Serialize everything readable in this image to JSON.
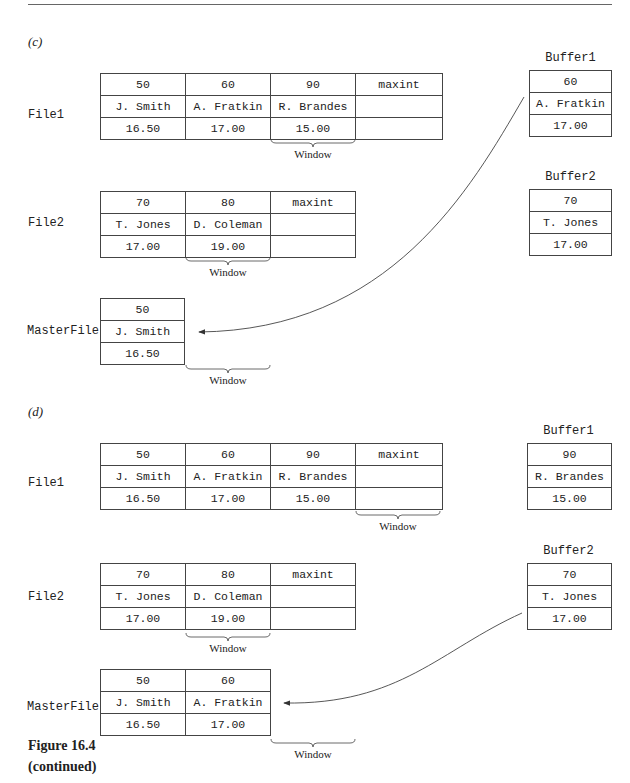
{
  "panels": {
    "c": {
      "label": "(c)",
      "file1": {
        "name": "File1",
        "keys": [
          "50",
          "60",
          "90",
          "maxint"
        ],
        "names": [
          "J. Smith",
          "A. Fratkin",
          "R. Brandes",
          ""
        ],
        "rates": [
          "16.50",
          "17.00",
          "15.00",
          ""
        ]
      },
      "file2": {
        "name": "File2",
        "keys": [
          "70",
          "80",
          "maxint"
        ],
        "names": [
          "T. Jones",
          "D. Coleman",
          ""
        ],
        "rates": [
          "17.00",
          "19.00",
          ""
        ]
      },
      "master": {
        "name": "MasterFile",
        "keys": [
          "50"
        ],
        "names": [
          "J. Smith"
        ],
        "rates": [
          "16.50"
        ]
      },
      "buffer1": {
        "name": "Buffer1",
        "key": "60",
        "nm": "A. Fratkin",
        "rate": "17.00"
      },
      "buffer2": {
        "name": "Buffer2",
        "key": "70",
        "nm": "T. Jones",
        "rate": "17.00"
      },
      "window_label": "Window"
    },
    "d": {
      "label": "(d)",
      "file1": {
        "name": "File1",
        "keys": [
          "50",
          "60",
          "90",
          "maxint"
        ],
        "names": [
          "J. Smith",
          "A. Fratkin",
          "R. Brandes",
          ""
        ],
        "rates": [
          "16.50",
          "17.00",
          "15.00",
          ""
        ]
      },
      "file2": {
        "name": "File2",
        "keys": [
          "70",
          "80",
          "maxint"
        ],
        "names": [
          "T. Jones",
          "D. Coleman",
          ""
        ],
        "rates": [
          "17.00",
          "19.00",
          ""
        ]
      },
      "master": {
        "name": "MasterFile",
        "keys": [
          "50",
          "60"
        ],
        "names": [
          "J. Smith",
          "A. Fratkin"
        ],
        "rates": [
          "16.50",
          "17.00"
        ]
      },
      "buffer1": {
        "name": "Buffer1",
        "key": "90",
        "nm": "R. Brandes",
        "rate": "15.00"
      },
      "buffer2": {
        "name": "Buffer2",
        "key": "70",
        "nm": "T. Jones",
        "rate": "17.00"
      },
      "window_label": "Window"
    }
  },
  "caption": {
    "line1": "Figure 16.4",
    "line2": "(continued)"
  }
}
